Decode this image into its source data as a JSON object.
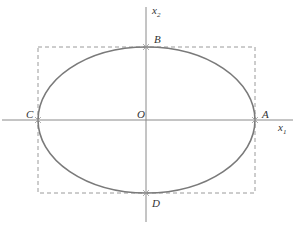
{
  "diagram": {
    "axes": {
      "horizontal": {
        "name": "x",
        "subscript": "1"
      },
      "vertical": {
        "name": "x",
        "subscript": "2"
      }
    },
    "points": {
      "origin": "O",
      "right": "A",
      "top": "B",
      "left": "C",
      "bottom": "D"
    }
  }
}
